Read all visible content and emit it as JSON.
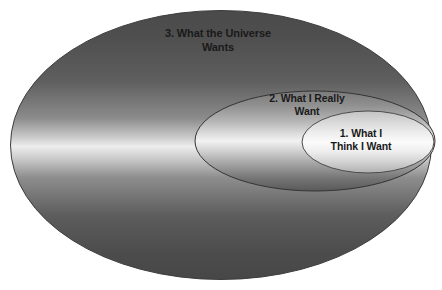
{
  "diagram": {
    "type": "concentric-ellipse-venn",
    "background_color": "#ffffff",
    "regions": [
      {
        "id": "outer",
        "order": 3,
        "label": "3. What the Universe\nWants",
        "shape": "ellipse",
        "fill_style": "vertical-metallic-gradient",
        "colors": {
          "edge_dark": "#4a4a4a",
          "highlight": "#ededed",
          "bottom_dark": "#474747",
          "outline": "#3d3d3d"
        },
        "geometry": {
          "cx": 221,
          "cy": 145,
          "rx": 211,
          "ry": 135
        }
      },
      {
        "id": "middle",
        "order": 2,
        "label": "2. What I Really\nWant",
        "shape": "ellipse",
        "fill_style": "vertical-metallic-gradient",
        "colors": {
          "edge_dark": "#6f6f6f",
          "highlight": "#f2f2f2",
          "bottom_dark": "#5a5a5a",
          "outline": "#3a3a3a"
        },
        "geometry": {
          "cx": 315,
          "cy": 141,
          "rx": 120,
          "ry": 50
        }
      },
      {
        "id": "inner",
        "order": 1,
        "label": "1. What I\nThink I Want",
        "shape": "ellipse",
        "fill_style": "vertical-light-gradient",
        "colors": {
          "edge_dark": "#b9b9b9",
          "highlight": "#fbfbfb",
          "bottom_dark": "#a8a8a8",
          "outline": "#4b4b4b"
        },
        "geometry": {
          "cx": 368,
          "cy": 142,
          "rx": 66,
          "ry": 31
        }
      }
    ],
    "text_color": "#1a1a1a"
  }
}
